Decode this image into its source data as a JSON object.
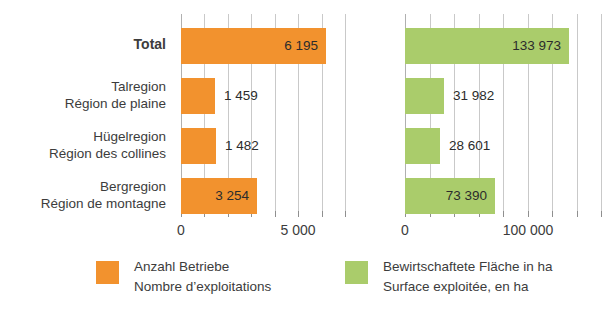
{
  "chart_data": {
    "type": "bar",
    "orientation": "horizontal",
    "title": "",
    "grid": true,
    "legend_position": "bottom",
    "categories": [
      {
        "de": "Total",
        "fr": "",
        "bold": true
      },
      {
        "de": "Talregion",
        "fr": "Région de plaine",
        "bold": false
      },
      {
        "de": "Hügelregion",
        "fr": "Région des collines",
        "bold": false
      },
      {
        "de": "Bergregion",
        "fr": "Région de montagne",
        "bold": false
      }
    ],
    "panels": [
      {
        "key": "holdings",
        "color": "#f2922e",
        "xlim": [
          0,
          7000
        ],
        "xticks": [
          0,
          5000
        ],
        "xtick_labels": [
          "0",
          "5 000"
        ],
        "gridline_step": 1000,
        "values": [
          6195,
          1459,
          1482,
          3254
        ],
        "value_labels": [
          "6 195",
          "1 459",
          "1 482",
          "3 254"
        ],
        "label_placement": [
          "inside",
          "outside",
          "outside",
          "inside"
        ]
      },
      {
        "key": "area",
        "color": "#aacc6b",
        "xlim": [
          0,
          160000
        ],
        "xticks": [
          0,
          100000
        ],
        "xtick_labels": [
          "0",
          "100 000"
        ],
        "gridline_step": 20000,
        "values": [
          133973,
          31982,
          28601,
          73390
        ],
        "value_labels": [
          "133 973",
          "31 982",
          "28 601",
          "73 390"
        ],
        "label_placement": [
          "inside",
          "outside",
          "outside",
          "inside"
        ]
      }
    ],
    "legend": [
      {
        "color": "#f2922e",
        "de": "Anzahl Betriebe",
        "fr": "Nombre d’exploitations"
      },
      {
        "color": "#aacc6b",
        "de": "Bewirtschaftete Fläche in ha",
        "fr": "Surface exploitée, en ha"
      }
    ]
  },
  "categories": {
    "row0": {
      "l1": "Total",
      "l2": ""
    },
    "row1": {
      "l1": "Talregion",
      "l2": "Région de plaine"
    },
    "row2": {
      "l1": "Hügelregion",
      "l2": "Région des collines"
    },
    "row3": {
      "l1": "Bergregion",
      "l2": "Région de montagne"
    }
  },
  "left_panel": {
    "values": {
      "v0": "6 195",
      "v1": "1 459",
      "v2": "1 482",
      "v3": "3 254"
    },
    "ticks": {
      "t0": "0",
      "t1": "5 000"
    }
  },
  "right_panel": {
    "values": {
      "v0": "133 973",
      "v1": "31 982",
      "v2": "28 601",
      "v3": "73 390"
    },
    "ticks": {
      "t0": "0",
      "t1": "100 000"
    }
  },
  "legend": {
    "item0": {
      "de": "Anzahl Betriebe",
      "fr": "Nombre d’exploitations"
    },
    "item1": {
      "de": "Bewirtschaftete Fläche in ha",
      "fr": "Surface exploitée, en ha"
    }
  }
}
